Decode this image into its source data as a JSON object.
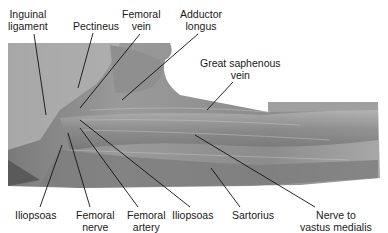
{
  "figure": {
    "labels": [
      {
        "id": "inguinal-ligament",
        "line1": "Inguinal",
        "line2": "ligament",
        "x": 22,
        "y": 8,
        "tx": 46,
        "ty": 115
      },
      {
        "id": "pectineus",
        "line1": "Pectineus",
        "line2": "",
        "x": 73,
        "y": 20,
        "tx": 78,
        "ty": 88
      },
      {
        "id": "femoral-vein",
        "line1": "Femoral",
        "line2": "vein",
        "x": 125,
        "y": 8,
        "tx": 80,
        "ty": 108
      },
      {
        "id": "adductor-longus",
        "line1": "Adductor",
        "line2": "longus",
        "x": 183,
        "y": 8,
        "tx": 122,
        "ty": 100
      },
      {
        "id": "great-saphenous-vein",
        "line1": "Great saphenous",
        "line2": "vein",
        "x": 200,
        "y": 56,
        "tx": 207,
        "ty": 110
      },
      {
        "id": "iliopsoas-left",
        "line1": "Iliopsoas",
        "line2": "",
        "x": 17,
        "y": 208,
        "tx": 62,
        "ty": 145
      },
      {
        "id": "femoral-nerve",
        "line1": "Femoral",
        "line2": "nerve",
        "x": 77,
        "y": 208,
        "tx": 68,
        "ty": 133
      },
      {
        "id": "femoral-artery",
        "line1": "Femoral",
        "line2": "artery",
        "x": 127,
        "y": 208,
        "tx": 80,
        "ty": 128
      },
      {
        "id": "iliopsoas-right",
        "line1": "Iliopsoas",
        "line2": "",
        "x": 176,
        "y": 208,
        "tx": 80,
        "ty": 120
      },
      {
        "id": "sartorius",
        "line1": "Sartorius",
        "line2": "",
        "x": 237,
        "y": 208,
        "tx": 211,
        "ty": 168
      },
      {
        "id": "nerve-to-vastus-medialis",
        "line1": "Nerve to",
        "line2": "vastus medialis",
        "x": 293,
        "y": 208,
        "tx": 195,
        "ty": 135
      }
    ]
  }
}
